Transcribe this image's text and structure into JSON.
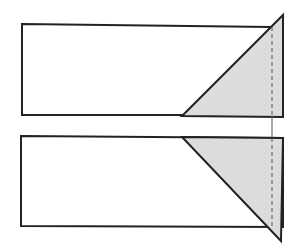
{
  "diagram": {
    "colors": {
      "stroke": "#222222",
      "fill_shade": "#dcdcdc",
      "background": "#ffffff",
      "dashed": "#555555"
    },
    "top_panel": {
      "rect": {
        "x1": 22,
        "y1": 24,
        "x2": 271,
        "y2": 115
      },
      "triangle": [
        [
          182,
          116
        ],
        [
          283,
          15
        ],
        [
          283,
          117
        ]
      ],
      "fold_line_x": 272
    },
    "bottom_panel": {
      "rect": {
        "x1": 21,
        "y1": 136,
        "x2": 270,
        "y2": 227
      },
      "triangle": [
        [
          182,
          137
        ],
        [
          283,
          138
        ],
        [
          281,
          241
        ]
      ],
      "fold_line_x": 272
    }
  }
}
